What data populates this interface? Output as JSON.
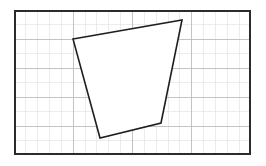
{
  "figure": {
    "kind": "geometry-quadrilateral-on-grid",
    "canvas": {
      "width": 266,
      "height": 166,
      "background": "#ffffff"
    },
    "frame": {
      "name": "grid-frame",
      "x": 14,
      "y": 10,
      "width": 237,
      "height": 145,
      "stroke": "#2b2b2b",
      "stroke_width": 2,
      "fill": "#ffffff"
    },
    "grid": {
      "minor_color": "#e4e4e4",
      "major_color": "#bdbdbd",
      "minor_width": 0.7,
      "major_width": 0.9,
      "column_spacing": 11.85,
      "row_spacing": 14.5,
      "columns": 20,
      "rows": 10,
      "major_every_columns": 5,
      "major_every_rows": 2
    },
    "shape": {
      "name": "quadrilateral",
      "label": "",
      "stroke": "#1e1e1e",
      "stroke_width": 1.6,
      "fill": "#ffffff",
      "closed": true,
      "vertices": [
        {
          "name": "top-left-vertex",
          "x": 73,
          "y": 39
        },
        {
          "name": "top-right-vertex",
          "x": 182,
          "y": 20
        },
        {
          "name": "bottom-right-vertex",
          "x": 161,
          "y": 123
        },
        {
          "name": "bottom-left-vertex",
          "x": 100,
          "y": 138
        }
      ]
    }
  },
  "chart_data": {
    "type": "scatter",
    "title": "",
    "subtitle": "",
    "xlabel": "",
    "ylabel": "",
    "grid": true,
    "legend": null,
    "xlim": [
      0,
      20
    ],
    "ylim": [
      0,
      10
    ],
    "annotations": [],
    "series": [
      {
        "name": "quadrilateral",
        "kind": "closed-polygon",
        "point_labels": [
          "A",
          "B",
          "C",
          "D"
        ],
        "x_pixels": [
          73,
          182,
          161,
          100
        ],
        "y_pixels": [
          39,
          20,
          123,
          138
        ],
        "x_grid": [
          4.98,
          14.18,
          12.41,
          7.26
        ],
        "y_grid": [
          8.0,
          9.31,
          2.21,
          1.17
        ]
      }
    ]
  }
}
